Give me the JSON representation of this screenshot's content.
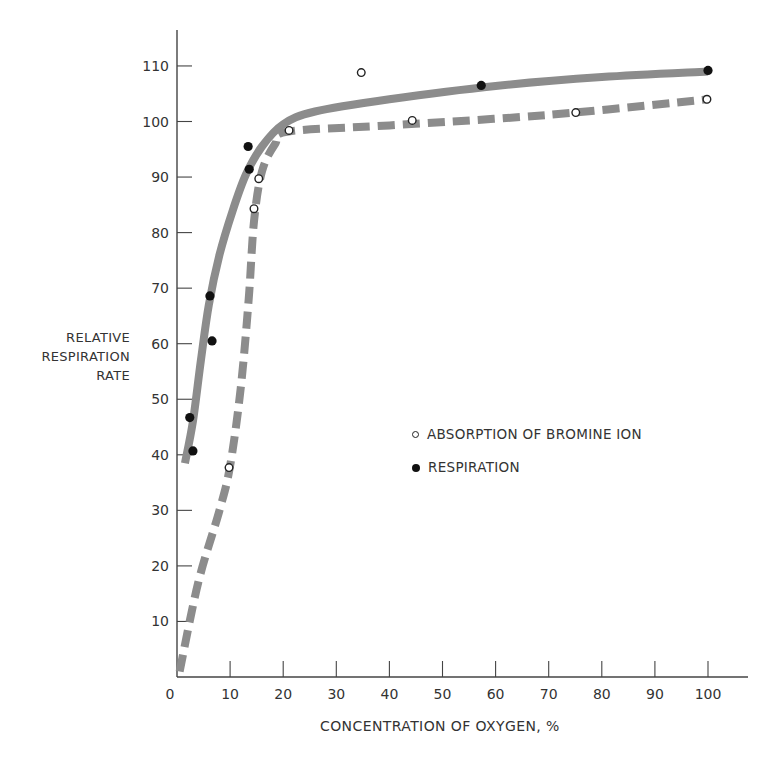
{
  "chart_data": {
    "type": "line",
    "title": "",
    "xlabel": "CONCENTRATION OF OXYGEN, %",
    "ylabel": [
      "RELATIVE",
      "RESPIRATION",
      "RATE"
    ],
    "xlim": [
      0,
      108
    ],
    "ylim": [
      0,
      116
    ],
    "x_ticks": [
      0,
      10,
      20,
      30,
      40,
      50,
      60,
      70,
      80,
      90,
      100
    ],
    "y_ticks": [
      10,
      20,
      30,
      40,
      50,
      60,
      70,
      80,
      90,
      100,
      110
    ],
    "grid": false,
    "legend_position": "center-right, inside plot",
    "series": [
      {
        "name": "ABSORPTION OF BROMINE ION",
        "marker": "open-circle",
        "line_style": "dashed",
        "line_color": "#8c8c8c",
        "points": [
          {
            "x": 9.8,
            "y": 37.7
          },
          {
            "x": 14.5,
            "y": 84.3
          },
          {
            "x": 15.4,
            "y": 89.7
          },
          {
            "x": 21.1,
            "y": 98.4
          },
          {
            "x": 34.7,
            "y": 108.8
          },
          {
            "x": 44.3,
            "y": 100.2
          },
          {
            "x": 75.1,
            "y": 101.6
          },
          {
            "x": 99.8,
            "y": 104.0
          }
        ],
        "curve": [
          {
            "x": 0.5,
            "y": 1
          },
          {
            "x": 4,
            "y": 17
          },
          {
            "x": 8,
            "y": 30
          },
          {
            "x": 10,
            "y": 38
          },
          {
            "x": 12,
            "y": 52
          },
          {
            "x": 13.5,
            "y": 68
          },
          {
            "x": 14.5,
            "y": 82
          },
          {
            "x": 16,
            "y": 91
          },
          {
            "x": 18.5,
            "y": 96
          },
          {
            "x": 21,
            "y": 98.2
          },
          {
            "x": 40,
            "y": 99.3
          },
          {
            "x": 70,
            "y": 101.2
          },
          {
            "x": 100,
            "y": 104
          }
        ]
      },
      {
        "name": "RESPIRATION",
        "marker": "filled-circle",
        "line_style": "solid",
        "line_color": "#8c8c8c",
        "points": [
          {
            "x": 2.4,
            "y": 46.7
          },
          {
            "x": 3.0,
            "y": 40.7
          },
          {
            "x": 6.2,
            "y": 68.6
          },
          {
            "x": 6.6,
            "y": 60.5
          },
          {
            "x": 13.4,
            "y": 95.5
          },
          {
            "x": 13.6,
            "y": 91.4
          },
          {
            "x": 57.3,
            "y": 106.5
          },
          {
            "x": 100.0,
            "y": 109.2
          }
        ],
        "curve": [
          {
            "x": 1.5,
            "y": 38.5
          },
          {
            "x": 3,
            "y": 46
          },
          {
            "x": 4.5,
            "y": 57
          },
          {
            "x": 6,
            "y": 67
          },
          {
            "x": 8,
            "y": 76
          },
          {
            "x": 10.5,
            "y": 84
          },
          {
            "x": 13,
            "y": 90.5
          },
          {
            "x": 16,
            "y": 95.5
          },
          {
            "x": 20,
            "y": 99.5
          },
          {
            "x": 26,
            "y": 101.8
          },
          {
            "x": 40,
            "y": 104
          },
          {
            "x": 60,
            "y": 106.4
          },
          {
            "x": 80,
            "y": 108
          },
          {
            "x": 100,
            "y": 109
          }
        ]
      }
    ]
  },
  "axis_color": "#444444",
  "curve_color": "#8c8c8c",
  "legend": {
    "items": [
      {
        "label": "ABSORPTION OF BROMINE ION",
        "marker": "open"
      },
      {
        "label": "RESPIRATION",
        "marker": "filled"
      }
    ]
  }
}
